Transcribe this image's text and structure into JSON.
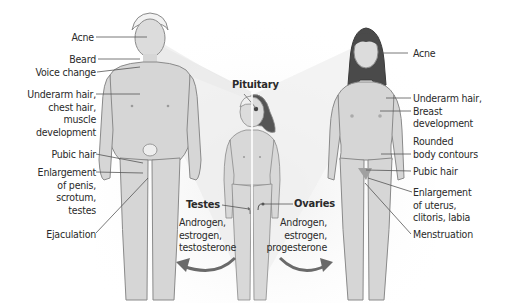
{
  "diagram": {
    "center": {
      "pituitary_label": "Pituitary",
      "testes_label": "Testes",
      "ovaries_label": "Ovaries",
      "male_hormones": [
        "Androgen,",
        "estrogen,",
        "testosterone"
      ],
      "female_hormones": [
        "Androgen,",
        "estrogen,",
        "progesterone"
      ]
    },
    "male_labels": [
      {
        "id": "acne",
        "lines": [
          "Acne"
        ]
      },
      {
        "id": "beard",
        "lines": [
          "Beard"
        ]
      },
      {
        "id": "voice",
        "lines": [
          "Voice change"
        ]
      },
      {
        "id": "underarm",
        "lines": [
          "Underarm hair,",
          "chest hair,",
          "muscle",
          "development"
        ]
      },
      {
        "id": "pubic",
        "lines": [
          "Pubic hair"
        ]
      },
      {
        "id": "enlargement",
        "lines": [
          "Enlargement",
          "of penis,",
          "scrotum,",
          "testes"
        ]
      },
      {
        "id": "ejaculation",
        "lines": [
          "Ejaculation"
        ]
      }
    ],
    "female_labels": [
      {
        "id": "acne",
        "lines": [
          "Acne"
        ]
      },
      {
        "id": "underarm",
        "lines": [
          "Underarm hair,",
          "Breast",
          "development"
        ]
      },
      {
        "id": "rounded",
        "lines": [
          "Rounded",
          "body contours"
        ]
      },
      {
        "id": "pubic",
        "lines": [
          "Pubic hair"
        ]
      },
      {
        "id": "enlargement",
        "lines": [
          "Enlargement",
          "of uterus,",
          "clitoris, labia"
        ]
      },
      {
        "id": "menstruation",
        "lines": [
          "Menstruation"
        ]
      }
    ],
    "colors": {
      "skin": "#d9d9d9",
      "outline": "#8a8a8a",
      "beam": "#e6e6e6",
      "hair_female": "#4a4a4a",
      "pubic_female": "#a0a0a0",
      "text": "#2a2a2a"
    }
  }
}
